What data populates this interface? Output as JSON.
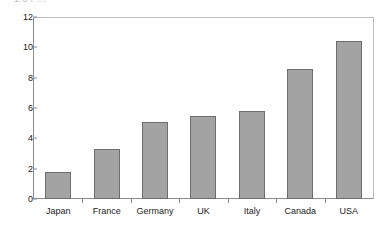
{
  "clipped_header_text": "1.0  /  ...",
  "chart_data": {
    "type": "bar",
    "title": "",
    "subtitle": "",
    "xlabel": "",
    "ylabel": "",
    "categories": [
      "Japan",
      "France",
      "Germany",
      "UK",
      "Italy",
      "Canada",
      "USA"
    ],
    "values": [
      1.8,
      3.3,
      5.1,
      5.5,
      5.8,
      8.6,
      10.4
    ],
    "series": [
      {
        "name": "",
        "values": [
          1.8,
          3.3,
          5.1,
          5.5,
          5.8,
          8.6,
          10.4
        ]
      }
    ],
    "ylim": [
      0,
      12
    ],
    "ytick_labels": [
      "0",
      "2",
      "4",
      "6",
      "8",
      "10",
      "12"
    ],
    "ytick_values": [
      0,
      2,
      4,
      6,
      8,
      10,
      12
    ],
    "grid": false,
    "legend": false,
    "legend_position": "none",
    "bar_color": "#a3a3a3",
    "bar_border_color": "#6e6e6e",
    "axis_color": "#8c8c8c",
    "frame_color": "#bfbfbf",
    "text_color": "#1a1a1a",
    "background": "#ffffff"
  }
}
